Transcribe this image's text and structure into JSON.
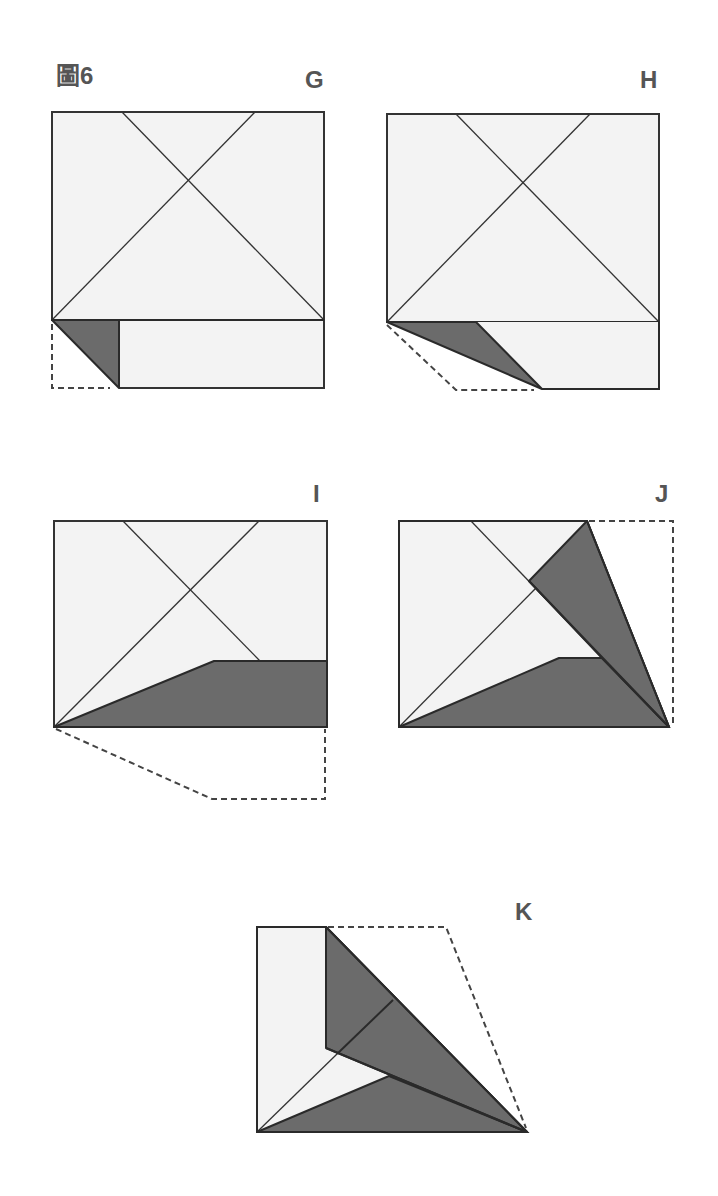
{
  "figure": {
    "title": "圖6",
    "colors": {
      "paper": "#f3f3f3",
      "flap": "#6b6b6b",
      "line": "#333333",
      "label": "#555555"
    }
  },
  "steps": [
    {
      "id": "G",
      "label": "G",
      "description": "Fold bottom-left corner of lower strip up (small triangle)"
    },
    {
      "id": "H",
      "label": "H",
      "description": "Fold corner further along diagonal"
    },
    {
      "id": "I",
      "label": "I",
      "description": "Fold lower strip up along angled crease"
    },
    {
      "id": "J",
      "label": "J",
      "description": "Fold right edge to diagonal"
    },
    {
      "id": "K",
      "label": "K",
      "description": "Fold top-right section over along diagonal"
    }
  ]
}
